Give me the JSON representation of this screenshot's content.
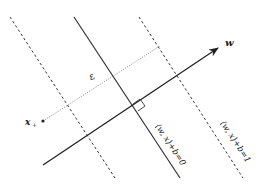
{
  "diagram": {
    "title": "",
    "labels": {
      "w": "w",
      "epsilon": "ε",
      "x_plus": "x",
      "x_plus_sub": "+",
      "hyperplane0": "⟨w, x⟩+b=0",
      "hyperplane1": "⟨w, x⟩+b=1"
    },
    "colors": {
      "line": "#222222",
      "dotted": "#555555",
      "background": "#ffffff"
    },
    "elements": {
      "left_margin": "dashed line",
      "decision_boundary": "solid line",
      "right_margin": "dashed line",
      "normal_vector": "arrow w",
      "distance": "dotted segment from x+",
      "right_angle_marker": "square"
    }
  }
}
